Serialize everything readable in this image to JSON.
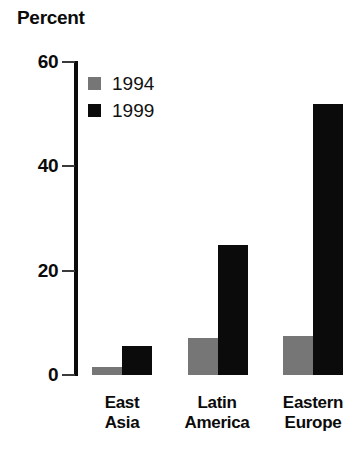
{
  "chart_data": {
    "type": "bar",
    "title": "Percent",
    "xlabel": "",
    "ylabel": "Percent",
    "categories": [
      "East\nAsia",
      "Latin\nAmerica",
      "Eastern\nEurope"
    ],
    "category_lines": [
      [
        "East",
        "Asia"
      ],
      [
        "Latin",
        "America"
      ],
      [
        "Eastern",
        "Europe"
      ]
    ],
    "series": [
      {
        "name": "1994",
        "color": "#767676",
        "values": [
          1.5,
          7,
          7.5
        ]
      },
      {
        "name": "1999",
        "color": "#0b0b0b",
        "values": [
          5.5,
          25,
          52
        ]
      }
    ],
    "ylim": [
      0,
      60
    ],
    "yticks": [
      0,
      20,
      40,
      60
    ],
    "ytick_labels": [
      "0",
      "20",
      "40",
      "60"
    ],
    "grid": false,
    "legend_position": "top-left-inside"
  },
  "legend": {
    "items": [
      {
        "label": "1994",
        "color": "#767676"
      },
      {
        "label": "1999",
        "color": "#0b0b0b"
      }
    ]
  },
  "axis": {
    "title": "Percent",
    "tick_labels": [
      "60",
      "40",
      "20",
      "0"
    ]
  }
}
